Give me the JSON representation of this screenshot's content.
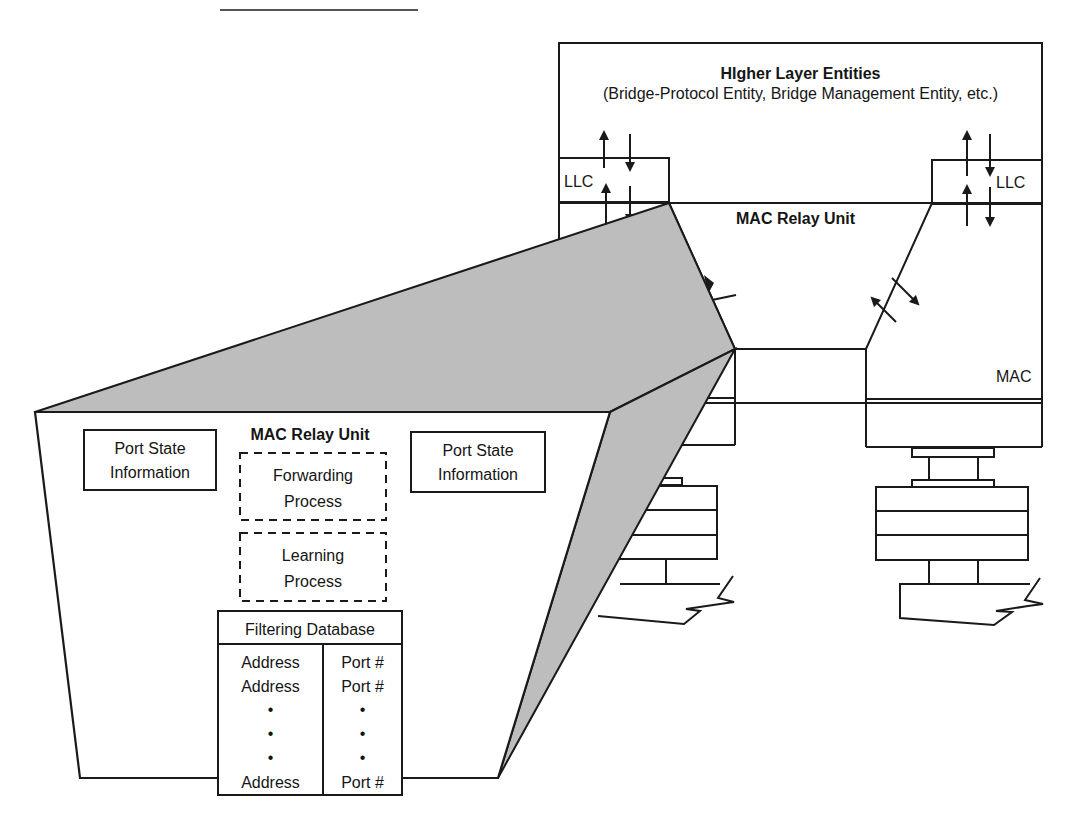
{
  "bridge": {
    "higher_layer": {
      "title": "HIgher Layer Entities",
      "subtitle": "(Bridge-Protocol Entity, Bridge Management Entity, etc.)"
    },
    "llc_left": "LLC",
    "llc_right": "LLC",
    "relay_title": "MAC Relay Unit",
    "mac_right": "MAC"
  },
  "zoom_view": {
    "title": "MAC Relay Unit",
    "port_state_left": [
      "Port State",
      "Information"
    ],
    "port_state_right": [
      "Port State",
      "Information"
    ],
    "forwarding": [
      "Forwarding",
      "Process"
    ],
    "learning": [
      "Learning",
      "Process"
    ],
    "filtering_db": {
      "title": "Filtering Database",
      "columns": [
        "Address",
        "Port #"
      ],
      "rows": [
        [
          "Address",
          "Port #"
        ],
        [
          "Address",
          "Port #"
        ],
        [
          "•",
          "•"
        ],
        [
          "•",
          "•"
        ],
        [
          "•",
          "•"
        ],
        [
          "Address",
          "Port #"
        ]
      ]
    }
  },
  "colors": {
    "line": "#1a1a1a",
    "wedge_fill": "#bdbdbd",
    "background": "#ffffff"
  }
}
